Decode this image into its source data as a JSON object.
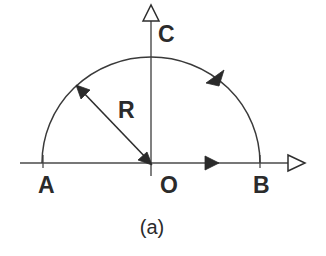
{
  "figure": {
    "caption": "(a)",
    "background_color": "#ffffff",
    "line_color": "#3a3a3a",
    "text_color": "#2b2b2b"
  },
  "labels": {
    "origin": "O",
    "left_point": "A",
    "right_point": "B",
    "top_point": "C",
    "radius": "R"
  },
  "geometry": {
    "origin_x": 151,
    "origin_y": 163,
    "radius_px": 109,
    "x_axis_start": 20,
    "x_axis_end": 305,
    "y_axis_top": 20,
    "y_axis_bottom": 176,
    "arc_description": "semicircle from A through C to B, traversed counterclockwise",
    "radius_arrow": "double-headed from origin O to arc point upper-left"
  },
  "icons": {
    "x_axis_arrowhead": "hollow-triangle-right-icon",
    "y_axis_arrowhead": "hollow-triangle-up-icon",
    "x_axis_direction_marker": "solid-triangle-right-icon",
    "arc_direction_marker": "solid-triangle-ccw-icon",
    "radius_arrowhead_origin": "solid-arrow-head-icon",
    "radius_arrowhead_arc": "solid-arrow-head-icon"
  }
}
